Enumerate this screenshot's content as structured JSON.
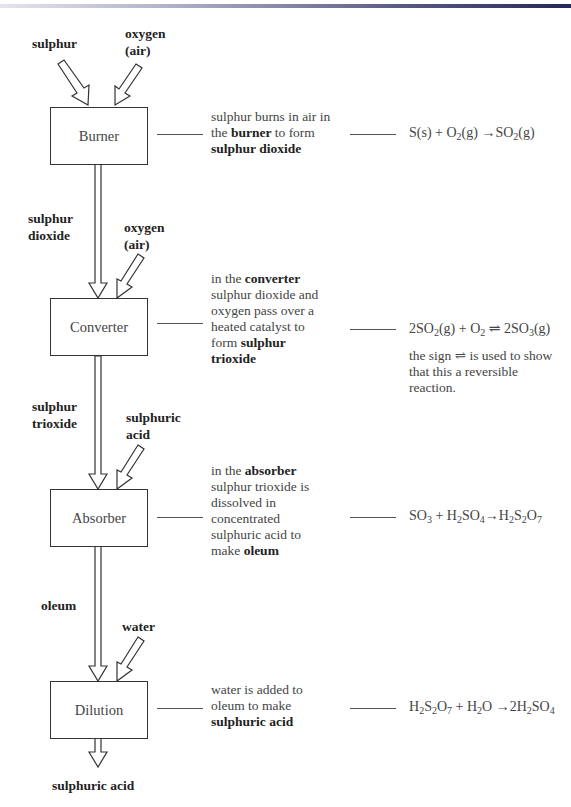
{
  "diagram": {
    "stages": [
      {
        "name": "Burner",
        "inputs": [
          "sulphur",
          "oxygen (air)"
        ],
        "description": [
          "sulphur burns in air in",
          "the ",
          "burner",
          " to form",
          "sulphur dioxide"
        ],
        "equation": "S(s) + O2(g) → SO2(g)"
      },
      {
        "name": "Converter",
        "inputs": [
          "sulphur dioxide",
          "oxygen (air)"
        ],
        "description": [
          "in the ",
          "converter",
          "sulphur dioxide and",
          "oxygen pass over a",
          "heated catalyst to",
          "form ",
          "sulphur",
          "trioxide"
        ],
        "equation": "2SO2(g) + O2 ⇌ 2SO3(g)",
        "note": [
          "the sign ⇌ is used to show",
          "that this a reversible",
          "reaction."
        ]
      },
      {
        "name": "Absorber",
        "inputs": [
          "sulphur trioxide",
          "sulphuric acid"
        ],
        "description": [
          "in the ",
          "absorber",
          "sulphur trioxide is",
          "dissolved in",
          "concentrated",
          "sulphuric acid to",
          "make ",
          "oleum"
        ],
        "equation": "SO3 + H2SO4 → H2S2O7"
      },
      {
        "name": "Dilution",
        "inputs": [
          "oleum",
          "water"
        ],
        "description": [
          "water is added to",
          "oleum to make",
          "sulphuric acid"
        ],
        "equation": "H2S2O7 + H2O → 2H2SO4"
      }
    ],
    "labels": {
      "sulphur": "sulphur",
      "oxygen": "oxygen",
      "air": "(air)",
      "sulphur_word": "sulphur",
      "dioxide": "dioxide",
      "trioxide": "trioxide",
      "sulphuric": "sulphuric",
      "acid": "acid",
      "oleum": "oleum",
      "water": "water",
      "output": "sulphuric acid"
    },
    "eq_parts": {
      "e1": {
        "a": "S(s) + O",
        "s1": "2",
        "b": "(g) →SO",
        "s2": "2",
        "c": "(g)"
      },
      "e2": {
        "a": "2SO",
        "s1": "2",
        "b": "(g) + O",
        "s2": "2",
        "c": " ⇌ 2SO",
        "s3": "3",
        "d": "(g)"
      },
      "e3": {
        "a": "SO",
        "s1": "3",
        "b": " + H",
        "s2": "2",
        "c": "SO",
        "s3": "4",
        "d": "→H",
        "s4": "2",
        "e": "S",
        "s5": "2",
        "f": "O",
        "s6": "7"
      },
      "e4": {
        "a": "H",
        "s1": "2",
        "b": "S",
        "s2": "2",
        "c": "O",
        "s3": "7",
        "d": " + H",
        "s4": "2",
        "e": "O →2H",
        "s5": "2",
        "f": "SO",
        "s6": "4"
      }
    },
    "colors": {
      "header_bar_end": "#262660",
      "line": "#333333"
    }
  }
}
